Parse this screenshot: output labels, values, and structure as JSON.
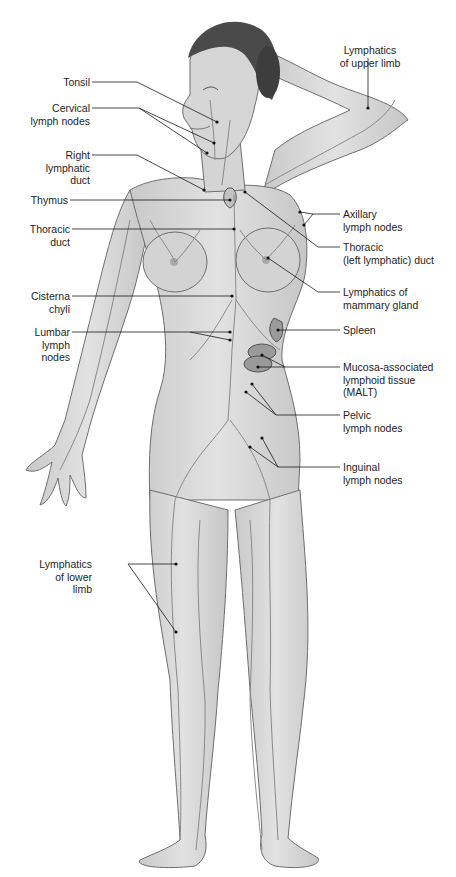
{
  "figure": {
    "colors": {
      "background": "#ffffff",
      "skin": "#d9d9d9",
      "skin_shadow": "#bdbdbd",
      "outline": "#6e6e6e",
      "lymph_vessels": "#8a8a8a",
      "hair": "#4a4a4a",
      "organ": "#9a9a9a",
      "leader_line": "#1a1a1a"
    }
  },
  "labels": {
    "left": [
      {
        "id": "tonsil",
        "text": "Tonsil"
      },
      {
        "id": "cervical",
        "text": "Cervical\nlymph nodes"
      },
      {
        "id": "right_duct",
        "text": "Right\nlymphatic\nduct"
      },
      {
        "id": "thymus",
        "text": "Thymus"
      },
      {
        "id": "thoracic_duct",
        "text": "Thoracic\nduct"
      },
      {
        "id": "cisterna",
        "text": "Cisterna\nchyli"
      },
      {
        "id": "lumbar",
        "text": "Lumbar\nlymph\nnodes"
      },
      {
        "id": "lower_limb",
        "text": "Lymphatics\nof lower\nlimb"
      }
    ],
    "right": [
      {
        "id": "upper_limb",
        "text": "Lymphatics\nof upper limb"
      },
      {
        "id": "axillary",
        "text": "Axillary\nlymph nodes"
      },
      {
        "id": "thoracic_left",
        "text": "Thoracic\n(left lymphatic) duct"
      },
      {
        "id": "mammary",
        "text": "Lymphatics of\nmammary gland"
      },
      {
        "id": "spleen",
        "text": "Spleen"
      },
      {
        "id": "malt",
        "text": "Mucosa-associated\nlymphoid tissue\n(MALT)"
      },
      {
        "id": "pelvic",
        "text": "Pelvic\nlymph nodes"
      },
      {
        "id": "inguinal",
        "text": "Inguinal\nlymph nodes"
      }
    ]
  }
}
